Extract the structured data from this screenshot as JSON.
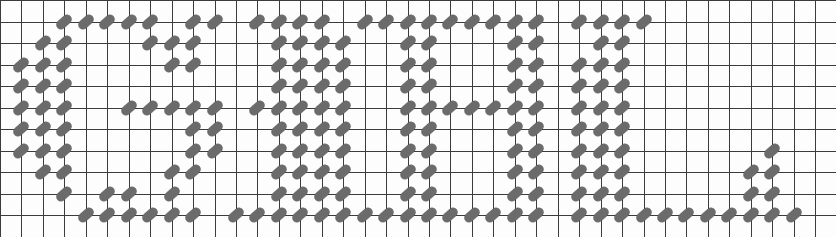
{
  "canvas": {
    "width": 836,
    "height": 237,
    "background_color": "#fdfdfd",
    "description": "Grid of square cells overlaid with short diagonal dash marks that spell out large block letters"
  },
  "grid": {
    "columns": 39,
    "rows": 11,
    "cell_width": 21.45,
    "cell_height": 21.5,
    "line_color": "#3c3c3c",
    "line_width_px": 1,
    "origin_x": 0,
    "origin_y": 0
  },
  "mark_style": {
    "shape": "capsule",
    "length_px": 17,
    "thickness_px": 9,
    "rotation_deg": -42,
    "fill_color": "#6b6b6b",
    "outline_color": "#3c3c3c"
  },
  "message": {
    "reading": "GIHUL",
    "letters": [
      {
        "glyph": "G",
        "column_start": 1,
        "column_end": 10
      },
      {
        "glyph": "I",
        "column_start": 11,
        "column_end": 17
      },
      {
        "glyph": "H",
        "column_start": 18,
        "column_end": 25
      },
      {
        "glyph": "U",
        "column_start": 26,
        "column_end": 31
      },
      {
        "glyph": "L",
        "column_start": 27,
        "column_end": 38
      }
    ]
  },
  "marks": [
    {
      "col": 3,
      "row": 1
    },
    {
      "col": 4,
      "row": 1
    },
    {
      "col": 5,
      "row": 1
    },
    {
      "col": 6,
      "row": 1
    },
    {
      "col": 7,
      "row": 1
    },
    {
      "col": 9,
      "row": 1
    },
    {
      "col": 10,
      "row": 1
    },
    {
      "col": 12,
      "row": 1
    },
    {
      "col": 13,
      "row": 1
    },
    {
      "col": 14,
      "row": 1
    },
    {
      "col": 15,
      "row": 1
    },
    {
      "col": 17,
      "row": 1
    },
    {
      "col": 18,
      "row": 1
    },
    {
      "col": 19,
      "row": 1
    },
    {
      "col": 20,
      "row": 1
    },
    {
      "col": 21,
      "row": 1
    },
    {
      "col": 22,
      "row": 1
    },
    {
      "col": 23,
      "row": 1
    },
    {
      "col": 24,
      "row": 1
    },
    {
      "col": 25,
      "row": 1
    },
    {
      "col": 27,
      "row": 1
    },
    {
      "col": 28,
      "row": 1
    },
    {
      "col": 29,
      "row": 1
    },
    {
      "col": 30,
      "row": 1
    },
    {
      "col": 2,
      "row": 2
    },
    {
      "col": 3,
      "row": 2
    },
    {
      "col": 7,
      "row": 2
    },
    {
      "col": 8,
      "row": 2
    },
    {
      "col": 9,
      "row": 2
    },
    {
      "col": 13,
      "row": 2
    },
    {
      "col": 14,
      "row": 2
    },
    {
      "col": 15,
      "row": 2
    },
    {
      "col": 16,
      "row": 2
    },
    {
      "col": 19,
      "row": 2
    },
    {
      "col": 20,
      "row": 2
    },
    {
      "col": 24,
      "row": 2
    },
    {
      "col": 25,
      "row": 2
    },
    {
      "col": 28,
      "row": 2
    },
    {
      "col": 29,
      "row": 2
    },
    {
      "col": 1,
      "row": 3
    },
    {
      "col": 2,
      "row": 3
    },
    {
      "col": 3,
      "row": 3
    },
    {
      "col": 8,
      "row": 3
    },
    {
      "col": 9,
      "row": 3
    },
    {
      "col": 13,
      "row": 3
    },
    {
      "col": 14,
      "row": 3
    },
    {
      "col": 15,
      "row": 3
    },
    {
      "col": 16,
      "row": 3
    },
    {
      "col": 19,
      "row": 3
    },
    {
      "col": 20,
      "row": 3
    },
    {
      "col": 24,
      "row": 3
    },
    {
      "col": 25,
      "row": 3
    },
    {
      "col": 27,
      "row": 3
    },
    {
      "col": 28,
      "row": 3
    },
    {
      "col": 29,
      "row": 3
    },
    {
      "col": 1,
      "row": 4
    },
    {
      "col": 2,
      "row": 4
    },
    {
      "col": 3,
      "row": 4
    },
    {
      "col": 13,
      "row": 4
    },
    {
      "col": 14,
      "row": 4
    },
    {
      "col": 15,
      "row": 4
    },
    {
      "col": 16,
      "row": 4
    },
    {
      "col": 19,
      "row": 4
    },
    {
      "col": 20,
      "row": 4
    },
    {
      "col": 24,
      "row": 4
    },
    {
      "col": 25,
      "row": 4
    },
    {
      "col": 27,
      "row": 4
    },
    {
      "col": 28,
      "row": 4
    },
    {
      "col": 29,
      "row": 4
    },
    {
      "col": 1,
      "row": 5
    },
    {
      "col": 2,
      "row": 5
    },
    {
      "col": 3,
      "row": 5
    },
    {
      "col": 6,
      "row": 5
    },
    {
      "col": 7,
      "row": 5
    },
    {
      "col": 8,
      "row": 5
    },
    {
      "col": 9,
      "row": 5
    },
    {
      "col": 10,
      "row": 5
    },
    {
      "col": 12,
      "row": 5
    },
    {
      "col": 13,
      "row": 5
    },
    {
      "col": 14,
      "row": 5
    },
    {
      "col": 15,
      "row": 5
    },
    {
      "col": 16,
      "row": 5
    },
    {
      "col": 19,
      "row": 5
    },
    {
      "col": 20,
      "row": 5
    },
    {
      "col": 21,
      "row": 5
    },
    {
      "col": 22,
      "row": 5
    },
    {
      "col": 23,
      "row": 5
    },
    {
      "col": 24,
      "row": 5
    },
    {
      "col": 25,
      "row": 5
    },
    {
      "col": 27,
      "row": 5
    },
    {
      "col": 28,
      "row": 5
    },
    {
      "col": 29,
      "row": 5
    },
    {
      "col": 1,
      "row": 6
    },
    {
      "col": 2,
      "row": 6
    },
    {
      "col": 3,
      "row": 6
    },
    {
      "col": 9,
      "row": 6
    },
    {
      "col": 10,
      "row": 6
    },
    {
      "col": 13,
      "row": 6
    },
    {
      "col": 14,
      "row": 6
    },
    {
      "col": 15,
      "row": 6
    },
    {
      "col": 16,
      "row": 6
    },
    {
      "col": 19,
      "row": 6
    },
    {
      "col": 20,
      "row": 6
    },
    {
      "col": 24,
      "row": 6
    },
    {
      "col": 25,
      "row": 6
    },
    {
      "col": 27,
      "row": 6
    },
    {
      "col": 28,
      "row": 6
    },
    {
      "col": 29,
      "row": 6
    },
    {
      "col": 1,
      "row": 7
    },
    {
      "col": 2,
      "row": 7
    },
    {
      "col": 3,
      "row": 7
    },
    {
      "col": 9,
      "row": 7
    },
    {
      "col": 10,
      "row": 7
    },
    {
      "col": 13,
      "row": 7
    },
    {
      "col": 14,
      "row": 7
    },
    {
      "col": 15,
      "row": 7
    },
    {
      "col": 16,
      "row": 7
    },
    {
      "col": 19,
      "row": 7
    },
    {
      "col": 20,
      "row": 7
    },
    {
      "col": 24,
      "row": 7
    },
    {
      "col": 25,
      "row": 7
    },
    {
      "col": 27,
      "row": 7
    },
    {
      "col": 28,
      "row": 7
    },
    {
      "col": 29,
      "row": 7
    },
    {
      "col": 36,
      "row": 7
    },
    {
      "col": 2,
      "row": 8
    },
    {
      "col": 3,
      "row": 8
    },
    {
      "col": 8,
      "row": 8
    },
    {
      "col": 9,
      "row": 8
    },
    {
      "col": 13,
      "row": 8
    },
    {
      "col": 14,
      "row": 8
    },
    {
      "col": 15,
      "row": 8
    },
    {
      "col": 16,
      "row": 8
    },
    {
      "col": 19,
      "row": 8
    },
    {
      "col": 20,
      "row": 8
    },
    {
      "col": 24,
      "row": 8
    },
    {
      "col": 25,
      "row": 8
    },
    {
      "col": 27,
      "row": 8
    },
    {
      "col": 28,
      "row": 8
    },
    {
      "col": 29,
      "row": 8
    },
    {
      "col": 35,
      "row": 8
    },
    {
      "col": 36,
      "row": 8
    },
    {
      "col": 3,
      "row": 9
    },
    {
      "col": 5,
      "row": 9
    },
    {
      "col": 6,
      "row": 9
    },
    {
      "col": 8,
      "row": 9
    },
    {
      "col": 13,
      "row": 9
    },
    {
      "col": 14,
      "row": 9
    },
    {
      "col": 15,
      "row": 9
    },
    {
      "col": 16,
      "row": 9
    },
    {
      "col": 19,
      "row": 9
    },
    {
      "col": 20,
      "row": 9
    },
    {
      "col": 24,
      "row": 9
    },
    {
      "col": 25,
      "row": 9
    },
    {
      "col": 27,
      "row": 9
    },
    {
      "col": 28,
      "row": 9
    },
    {
      "col": 29,
      "row": 9
    },
    {
      "col": 35,
      "row": 9
    },
    {
      "col": 36,
      "row": 9
    },
    {
      "col": 4,
      "row": 10
    },
    {
      "col": 5,
      "row": 10
    },
    {
      "col": 6,
      "row": 10
    },
    {
      "col": 7,
      "row": 10
    },
    {
      "col": 8,
      "row": 10
    },
    {
      "col": 9,
      "row": 10
    },
    {
      "col": 11,
      "row": 10
    },
    {
      "col": 12,
      "row": 10
    },
    {
      "col": 13,
      "row": 10
    },
    {
      "col": 14,
      "row": 10
    },
    {
      "col": 15,
      "row": 10
    },
    {
      "col": 16,
      "row": 10
    },
    {
      "col": 17,
      "row": 10
    },
    {
      "col": 18,
      "row": 10
    },
    {
      "col": 19,
      "row": 10
    },
    {
      "col": 20,
      "row": 10
    },
    {
      "col": 21,
      "row": 10
    },
    {
      "col": 22,
      "row": 10
    },
    {
      "col": 23,
      "row": 10
    },
    {
      "col": 24,
      "row": 10
    },
    {
      "col": 25,
      "row": 10
    },
    {
      "col": 27,
      "row": 10
    },
    {
      "col": 28,
      "row": 10
    },
    {
      "col": 29,
      "row": 10
    },
    {
      "col": 30,
      "row": 10
    },
    {
      "col": 31,
      "row": 10
    },
    {
      "col": 32,
      "row": 10
    },
    {
      "col": 33,
      "row": 10
    },
    {
      "col": 34,
      "row": 10
    },
    {
      "col": 35,
      "row": 10
    },
    {
      "col": 36,
      "row": 10
    },
    {
      "col": 37,
      "row": 10
    }
  ]
}
